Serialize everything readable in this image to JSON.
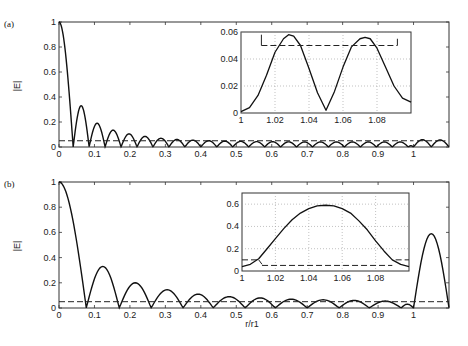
{
  "panels": [
    {
      "id": "a",
      "label": "(a)",
      "ylabel": "|E|"
    },
    {
      "id": "b",
      "label": "(b)",
      "ylabel": "|E|"
    }
  ],
  "xlabel": "r/r1",
  "chart_data": [
    {
      "type": "line",
      "title": "(a)",
      "xlabel": "",
      "ylabel": "|E|",
      "xlim": [
        0,
        1.1
      ],
      "ylim": [
        0,
        1
      ],
      "xticks": [
        "0",
        "0.1",
        "0.2",
        "0.3",
        "0.4",
        "0.5",
        "0.6",
        "0.7",
        "0.8",
        "0.9",
        "1"
      ],
      "yticks": [
        "0",
        "0.2",
        "0.4",
        "0.6",
        "0.8",
        "1"
      ],
      "grid": false,
      "series": [
        {
          "name": "|E| solid",
          "style": "solid",
          "lobes": {
            "zeros": [
              0.0,
              0.04,
              0.085,
              0.13,
              0.175,
              0.22,
              0.265,
              0.31,
              0.355,
              0.4,
              0.445,
              0.49,
              0.535,
              0.58,
              0.625,
              0.67,
              0.715,
              0.76,
              0.805,
              0.85,
              0.895,
              0.94,
              0.985,
              1.0,
              1.05,
              1.1
            ],
            "peaks": [
              1.0,
              0.33,
              0.19,
              0.135,
              0.105,
              0.085,
              0.07,
              0.06,
              0.055,
              0.05,
              0.047,
              0.045,
              0.043,
              0.042,
              0.041,
              0.04,
              0.04,
              0.04,
              0.04,
              0.04,
              0.04,
              0.04,
              0.01,
              0.058,
              0.056
            ]
          }
        },
        {
          "name": "threshold",
          "style": "dashed",
          "segments": [
            [
              0,
              0.05,
              1.0,
              0.05
            ],
            [
              1.01,
              0.05,
              1.09,
              0.05
            ]
          ]
        }
      ],
      "inset": {
        "xlim": [
          1,
          1.1
        ],
        "ylim": [
          0,
          0.06
        ],
        "xticks": [
          "1",
          "1.02",
          "1.04",
          "1.06",
          "1.08"
        ],
        "yticks": [
          "0",
          "0.02",
          "0.04",
          "0.06"
        ],
        "grid": true,
        "solid": {
          "x": [
            1.0,
            1.005,
            1.01,
            1.015,
            1.02,
            1.025,
            1.028,
            1.031,
            1.035,
            1.04,
            1.045,
            1.05,
            1.055,
            1.06,
            1.065,
            1.07,
            1.073,
            1.076,
            1.08,
            1.085,
            1.09,
            1.095,
            1.1
          ],
          "y": [
            0.001,
            0.004,
            0.013,
            0.028,
            0.045,
            0.055,
            0.058,
            0.057,
            0.05,
            0.033,
            0.015,
            0.002,
            0.016,
            0.034,
            0.049,
            0.055,
            0.056,
            0.055,
            0.048,
            0.034,
            0.02,
            0.011,
            0.008
          ]
        },
        "dashed": {
          "segments": [
            [
              1.012,
              0.05,
              1.092,
              0.05
            ]
          ],
          "ticks": [
            [
              1.012,
              0.05,
              1.012,
              0.058
            ],
            [
              1.092,
              0.05,
              1.092,
              0.055
            ]
          ]
        }
      }
    },
    {
      "type": "line",
      "title": "(b)",
      "xlabel": "r/r1",
      "ylabel": "|E|",
      "xlim": [
        0,
        1.1
      ],
      "ylim": [
        0,
        1
      ],
      "xticks": [
        "0",
        "0.1",
        "0.2",
        "0.3",
        "0.4",
        "0.5",
        "0.6",
        "0.7",
        "0.8",
        "0.9",
        "1"
      ],
      "yticks": [
        "0",
        "0.2",
        "0.4",
        "0.6",
        "0.8",
        "1"
      ],
      "grid": false,
      "series": [
        {
          "name": "|E| solid",
          "style": "solid",
          "lobes": {
            "zeros": [
              0.0,
              0.077,
              0.17,
              0.26,
              0.35,
              0.435,
              0.525,
              0.61,
              0.7,
              0.79,
              0.875,
              0.965,
              1.0,
              1.1
            ],
            "peaks": [
              1.0,
              0.33,
              0.2,
              0.145,
              0.11,
              0.09,
              0.08,
              0.07,
              0.065,
              0.06,
              0.055,
              0.03,
              0.59
            ]
          }
        },
        {
          "name": "threshold",
          "style": "dashed",
          "segments": [
            [
              0,
              0.05,
              1.1,
              0.05
            ]
          ]
        }
      ],
      "inset": {
        "xlim": [
          1,
          1.1
        ],
        "ylim": [
          0,
          0.7
        ],
        "xticks": [
          "1",
          "1.02",
          "1.04",
          "1.06",
          "1.08"
        ],
        "yticks": [
          "0",
          "0.2",
          "0.4",
          "0.6"
        ],
        "grid": true,
        "solid": {
          "x": [
            1.0,
            1.005,
            1.01,
            1.015,
            1.02,
            1.025,
            1.03,
            1.035,
            1.04,
            1.045,
            1.05,
            1.055,
            1.06,
            1.065,
            1.07,
            1.075,
            1.08,
            1.085,
            1.09,
            1.095,
            1.1
          ],
          "y": [
            0.04,
            0.06,
            0.11,
            0.2,
            0.29,
            0.38,
            0.46,
            0.52,
            0.56,
            0.585,
            0.59,
            0.585,
            0.56,
            0.52,
            0.45,
            0.37,
            0.27,
            0.18,
            0.1,
            0.06,
            0.04
          ]
        },
        "dashed": {
          "segments": [
            [
              1.0,
              0.1,
              1.01,
              0.1
            ],
            [
              1.012,
              0.05,
              1.09,
              0.05
            ],
            [
              1.092,
              0.1,
              1.1,
              0.1
            ]
          ],
          "ticks": [
            [
              1.01,
              0.1,
              1.012,
              0.06
            ]
          ]
        }
      }
    }
  ]
}
